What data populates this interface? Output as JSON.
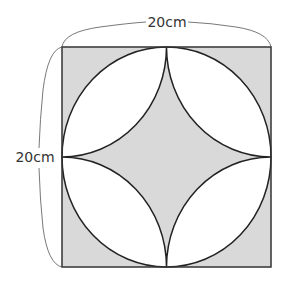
{
  "figure": {
    "top_dimension_label": "20cm",
    "left_dimension_label": "20cm",
    "shade_color": "#d9d9d9",
    "line_color": "#222222",
    "shapes": [
      "square",
      "inscribed-circle",
      "four-quarter-arcs-from-edge-midpoints",
      "shaded-corners",
      "shaded-center-star"
    ]
  }
}
